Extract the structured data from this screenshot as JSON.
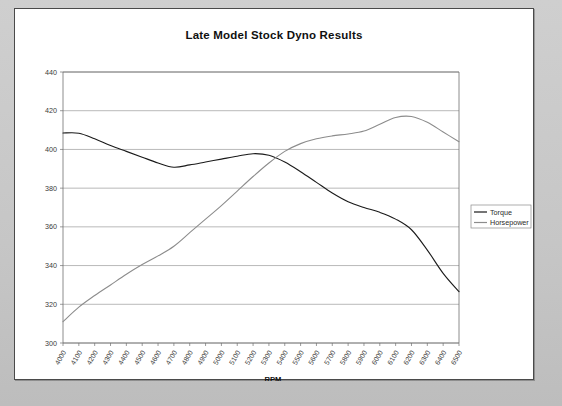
{
  "window": {
    "background_color": "#c9c9c9",
    "panel_color": "#ffffff",
    "border_color": "#4a4a4a"
  },
  "chart_data": {
    "type": "line",
    "title": "Late Model Stock Dyno Results",
    "xlabel": "RPM",
    "ylabel": "",
    "ylim": [
      300,
      440
    ],
    "ytick_step": 20,
    "yticks": [
      300,
      320,
      340,
      360,
      380,
      400,
      420,
      440
    ],
    "grid": true,
    "legend_position": "right",
    "categories": [
      "4000",
      "4100",
      "4200",
      "4300",
      "4400",
      "4500",
      "4600",
      "4700",
      "4800",
      "4900",
      "5000",
      "5100",
      "5200",
      "5300",
      "5400",
      "5500",
      "5600",
      "5700",
      "5800",
      "5900",
      "6000",
      "6100",
      "6200",
      "6300",
      "6400",
      "6500"
    ],
    "series": [
      {
        "name": "Torque",
        "color": "#1a1a1a",
        "values": [
          408.5,
          408.4,
          405.5,
          402.0,
          399.0,
          396.0,
          393.0,
          390.8,
          392.0,
          393.5,
          395.0,
          396.5,
          397.8,
          397.0,
          393.5,
          388.5,
          383.0,
          377.5,
          373.0,
          370.0,
          367.5,
          364.0,
          358.5,
          348.0,
          336.0,
          326.5
        ]
      },
      {
        "name": "Horsepower",
        "color": "#8c8c8c",
        "values": [
          311.0,
          318.5,
          324.5,
          330.0,
          335.5,
          340.5,
          345.0,
          350.0,
          357.0,
          364.0,
          371.0,
          378.5,
          386.0,
          393.0,
          399.0,
          403.0,
          405.5,
          407.0,
          408.0,
          409.5,
          413.0,
          416.5,
          417.0,
          414.0,
          409.0,
          404.0
        ]
      }
    ]
  },
  "legend": {
    "entries": [
      {
        "label": "Torque",
        "color": "#1a1a1a"
      },
      {
        "label": "Horsepower",
        "color": "#8c8c8c"
      }
    ]
  }
}
